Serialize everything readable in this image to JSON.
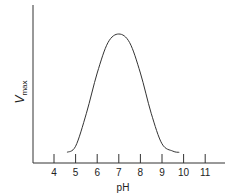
{
  "chart_data": {
    "type": "line",
    "title": "",
    "xlabel": "pH",
    "ylabel": "V",
    "ylabel_subscript": "max",
    "x_ticks": [
      "4",
      "5",
      "6",
      "7",
      "8",
      "9",
      "10",
      "11"
    ],
    "xlim": [
      3,
      11.8
    ],
    "y_ticks": [],
    "grid": false,
    "legend": null,
    "series": [
      {
        "name": "Vmax vs pH",
        "x": [
          4.6,
          5.0,
          5.5,
          6.0,
          6.5,
          7.0,
          7.5,
          8.0,
          8.5,
          9.0,
          9.5,
          9.8
        ],
        "y": [
          0.03,
          0.08,
          0.35,
          0.68,
          0.93,
          1.0,
          0.93,
          0.68,
          0.35,
          0.1,
          0.04,
          0.03
        ]
      }
    ],
    "annotations": []
  },
  "axes": {
    "x_label": "pH",
    "y_label_main": "V",
    "y_label_sub": "max"
  },
  "colors": {
    "line": "#333333",
    "axis": "#333333"
  }
}
